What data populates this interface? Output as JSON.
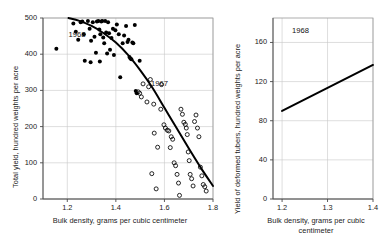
{
  "figure": {
    "background": "#ffffff",
    "ink": "#1a1a1a",
    "grid_color": "#c8c8c8",
    "frame_color": "#9a9a9a"
  },
  "chart_data": [
    {
      "id": "left-panel",
      "type": "scatter",
      "title": "",
      "xlabel": "Bulk density, grams per cubic centimeter",
      "ylabel": "Total yield, hundred weights per acre",
      "xlim": [
        1.1,
        1.8
      ],
      "ylim": [
        0,
        500
      ],
      "xticks": [
        "1.2",
        "1.4",
        "1.6",
        "1.8"
      ],
      "xtick_values": [
        1.2,
        1.4,
        1.6,
        1.8
      ],
      "yticks": [
        "0",
        "100",
        "200",
        "300",
        "400",
        "500"
      ],
      "ytick_values": [
        0,
        100,
        200,
        300,
        400,
        500
      ],
      "grid": true,
      "legend_position": "inline-annotations",
      "annotations": [
        {
          "text": "1968",
          "x": 1.205,
          "y": 452
        },
        {
          "text": "1967",
          "x": 1.545,
          "y": 318
        }
      ],
      "series": [
        {
          "name": "1968",
          "marker": "filled-circle",
          "color": "#000000",
          "points": [
            [
              1.155,
              415
            ],
            [
              1.225,
              485
            ],
            [
              1.235,
              462
            ],
            [
              1.245,
              440
            ],
            [
              1.255,
              488
            ],
            [
              1.262,
              490
            ],
            [
              1.268,
              455
            ],
            [
              1.272,
              382
            ],
            [
              1.285,
              492
            ],
            [
              1.292,
              470
            ],
            [
              1.298,
              437
            ],
            [
              1.305,
              488
            ],
            [
              1.312,
              448
            ],
            [
              1.318,
              404
            ],
            [
              1.322,
              490
            ],
            [
              1.328,
              492
            ],
            [
              1.332,
              468
            ],
            [
              1.336,
              455
            ],
            [
              1.34,
              490
            ],
            [
              1.344,
              492
            ],
            [
              1.348,
              446
            ],
            [
              1.352,
              430
            ],
            [
              1.356,
              492
            ],
            [
              1.36,
              460
            ],
            [
              1.364,
              402
            ],
            [
              1.368,
              488
            ],
            [
              1.372,
              458
            ],
            [
              1.376,
              412
            ],
            [
              1.382,
              445
            ],
            [
              1.388,
              470
            ],
            [
              1.392,
              398
            ],
            [
              1.398,
              466
            ],
            [
              1.404,
              482
            ],
            [
              1.412,
              455
            ],
            [
              1.418,
              336
            ],
            [
              1.428,
              430
            ],
            [
              1.434,
              452
            ],
            [
              1.442,
              478
            ],
            [
              1.448,
              434
            ],
            [
              1.452,
              440
            ],
            [
              1.456,
              392
            ],
            [
              1.46,
              388
            ],
            [
              1.464,
              386
            ],
            [
              1.468,
              432
            ],
            [
              1.472,
              430
            ],
            [
              1.478,
              481
            ],
            [
              1.482,
              298
            ],
            [
              1.486,
              292
            ],
            [
              1.498,
              382
            ],
            [
              1.334,
              380
            ],
            [
              1.296,
              378
            ]
          ]
        },
        {
          "name": "1967",
          "marker": "open-circle",
          "color": "#000000",
          "points": [
            [
              1.492,
              296
            ],
            [
              1.498,
              292
            ],
            [
              1.505,
              282
            ],
            [
              1.512,
              318
            ],
            [
              1.528,
              268
            ],
            [
              1.535,
              310
            ],
            [
              1.542,
              330
            ],
            [
              1.548,
              70
            ],
            [
              1.558,
              182
            ],
            [
              1.566,
              28
            ],
            [
              1.572,
              143
            ],
            [
              1.585,
              248
            ],
            [
              1.598,
              205
            ],
            [
              1.604,
              196
            ],
            [
              1.612,
              190
            ],
            [
              1.618,
              188
            ],
            [
              1.624,
              142
            ],
            [
              1.628,
              172
            ],
            [
              1.634,
              165
            ],
            [
              1.64,
              100
            ],
            [
              1.646,
              92
            ],
            [
              1.652,
              68
            ],
            [
              1.658,
              44
            ],
            [
              1.662,
              10
            ],
            [
              1.668,
              248
            ],
            [
              1.674,
              234
            ],
            [
              1.68,
              212
            ],
            [
              1.686,
              206
            ],
            [
              1.69,
              196
            ],
            [
              1.694,
              178
            ],
            [
              1.698,
              130
            ],
            [
              1.702,
              106
            ],
            [
              1.706,
              68
            ],
            [
              1.712,
              56
            ],
            [
              1.718,
              36
            ],
            [
              1.724,
              214
            ],
            [
              1.73,
              232
            ],
            [
              1.736,
              196
            ],
            [
              1.742,
              172
            ],
            [
              1.748,
              88
            ],
            [
              1.754,
              64
            ],
            [
              1.76,
              40
            ],
            [
              1.766,
              34
            ],
            [
              1.772,
              22
            ],
            [
              1.588,
              316
            ],
            [
              1.556,
              262
            ]
          ]
        }
      ],
      "fit_curve": {
        "name": "fitted-trend",
        "color": "#000000",
        "points": [
          [
            1.205,
            500
          ],
          [
            1.25,
            492
          ],
          [
            1.3,
            478
          ],
          [
            1.35,
            458
          ],
          [
            1.4,
            432
          ],
          [
            1.45,
            398
          ],
          [
            1.5,
            356
          ],
          [
            1.55,
            308
          ],
          [
            1.6,
            252
          ],
          [
            1.65,
            196
          ],
          [
            1.7,
            140
          ],
          [
            1.75,
            86
          ],
          [
            1.8,
            36
          ]
        ]
      }
    },
    {
      "id": "right-panel",
      "type": "line",
      "title": "",
      "xlabel": "Bulk density, grams per cubic\ncentimeter",
      "ylabel": "Yield of deformed tubers, hundred weights per acre",
      "xlim": [
        1.18,
        1.4
      ],
      "ylim": [
        0,
        185
      ],
      "xticks": [
        "1.2",
        "1.3",
        "1.4"
      ],
      "xtick_values": [
        1.2,
        1.3,
        1.4
      ],
      "yticks": [
        "0",
        "40",
        "80",
        "120",
        "160"
      ],
      "ytick_values": [
        0,
        40,
        80,
        120,
        160
      ],
      "grid": true,
      "annotations": [
        {
          "text": "1968",
          "x": 1.222,
          "y": 172
        }
      ],
      "series": [
        {
          "name": "1968",
          "marker": "none",
          "color": "#000000",
          "points": [
            [
              1.2,
              90
            ],
            [
              1.4,
              137
            ]
          ]
        }
      ]
    }
  ]
}
